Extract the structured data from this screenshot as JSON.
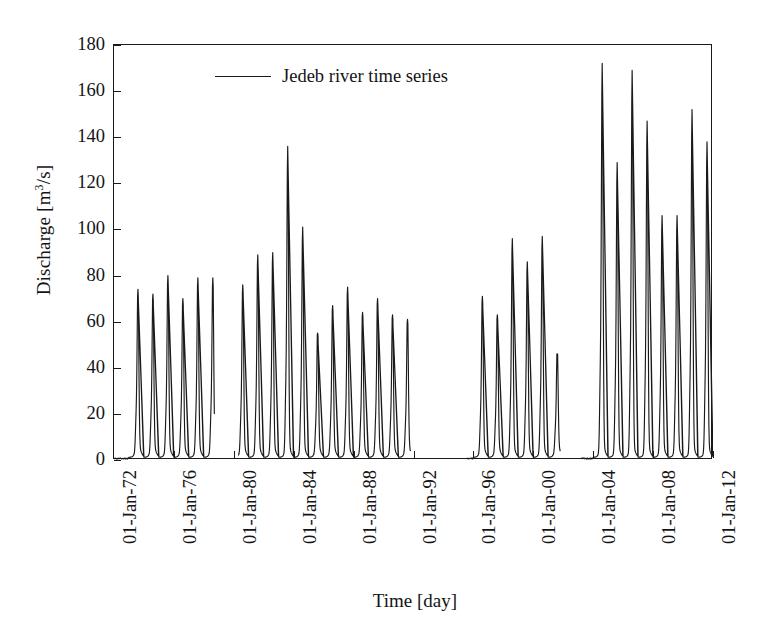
{
  "chart_data": {
    "type": "line",
    "title": "",
    "xlabel": "Time [day]",
    "ylabel": "Discharge [m3/s]",
    "ylabel_parts": {
      "prefix": "Discharge [m",
      "sup": "3",
      "suffix": "/s]"
    },
    "ylim": [
      0,
      180
    ],
    "yticks": [
      0,
      20,
      40,
      60,
      80,
      100,
      120,
      140,
      160,
      180
    ],
    "xlim": [
      "01-Jan-72",
      "01-Jan-12"
    ],
    "xticks": [
      "01-Jan-72",
      "01-Jan-76",
      "01-Jan-80",
      "01-Jan-84",
      "01-Jan-88",
      "01-Jan-92",
      "01-Jan-96",
      "01-Jan-00",
      "01-Jan-04",
      "01-Jan-08",
      "01-Jan-12"
    ],
    "grid": false,
    "legend_position": "top-center",
    "series": [
      {
        "name": "Jedeb river time series",
        "color": "#1a1a1a",
        "description": "Daily discharge hydrograph with one sharp monsoon peak per year; record has gaps with no data.",
        "annual_peaks": [
          {
            "year": 1973,
            "peak": 74
          },
          {
            "year": 1974,
            "peak": 72
          },
          {
            "year": 1975,
            "peak": 80
          },
          {
            "year": 1976,
            "peak": 70
          },
          {
            "year": 1977,
            "peak": 79
          },
          {
            "year": 1978,
            "peak": 79
          },
          {
            "year": 1980,
            "peak": 76
          },
          {
            "year": 1981,
            "peak": 89
          },
          {
            "year": 1982,
            "peak": 90
          },
          {
            "year": 1983,
            "peak": 136
          },
          {
            "year": 1984,
            "peak": 101
          },
          {
            "year": 1985,
            "peak": 55
          },
          {
            "year": 1986,
            "peak": 67
          },
          {
            "year": 1987,
            "peak": 75
          },
          {
            "year": 1988,
            "peak": 64
          },
          {
            "year": 1989,
            "peak": 70
          },
          {
            "year": 1990,
            "peak": 63
          },
          {
            "year": 1991,
            "peak": 61
          },
          {
            "year": 1996,
            "peak": 71
          },
          {
            "year": 1997,
            "peak": 63
          },
          {
            "year": 1998,
            "peak": 96
          },
          {
            "year": 1999,
            "peak": 86
          },
          {
            "year": 2000,
            "peak": 97
          },
          {
            "year": 2001,
            "peak": 46
          },
          {
            "year": 2004,
            "peak": 172
          },
          {
            "year": 2005,
            "peak": 129
          },
          {
            "year": 2006,
            "peak": 169
          },
          {
            "year": 2007,
            "peak": 147
          },
          {
            "year": 2008,
            "peak": 106
          },
          {
            "year": 2009,
            "peak": 106
          },
          {
            "year": 2010,
            "peak": 152
          },
          {
            "year": 2011,
            "peak": 138
          },
          {
            "year": 2012,
            "peak": 124
          }
        ],
        "gaps": [
          {
            "from": 1978.7,
            "to": 1980.3
          },
          {
            "from": 1991.8,
            "to": 1995.6
          },
          {
            "from": 2001.8,
            "to": 2003.2
          }
        ]
      }
    ]
  },
  "legend": {
    "entries": [
      {
        "label": "Jedeb river time series",
        "marker": "line"
      }
    ]
  },
  "axes": {
    "y_title_prefix": "Discharge [m",
    "y_title_sup": "3",
    "y_title_suffix": "/s]",
    "x_title": "Time [day]"
  }
}
